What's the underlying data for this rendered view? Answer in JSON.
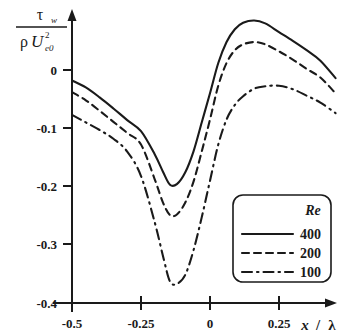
{
  "chart_data": {
    "type": "line",
    "title": "",
    "xlabel": "x / λ",
    "ylabel": "τ_w / (ρ U_e0^2)",
    "xlim": [
      -0.5,
      0.46
    ],
    "ylim": [
      -0.4,
      0.1
    ],
    "xticks": [
      -0.5,
      -0.25,
      0,
      0.25
    ],
    "xticklabels": [
      "-0.5",
      "-0.25",
      "0",
      "0.25"
    ],
    "yticks": [
      0,
      -0.1,
      -0.2,
      -0.3,
      -0.4
    ],
    "yticklabels": [
      "0",
      "-0.1",
      "-0.2",
      "-0.3",
      "-0.4"
    ],
    "grid": false,
    "legend_position": "lower-right",
    "legend_title": "Re",
    "series": [
      {
        "name": "400",
        "style": "solid",
        "x": [
          -0.5,
          -0.45,
          -0.4,
          -0.35,
          -0.3,
          -0.25,
          -0.2,
          -0.17,
          -0.145,
          -0.12,
          -0.09,
          -0.06,
          -0.03,
          0.0,
          0.03,
          0.06,
          0.09,
          0.12,
          0.16,
          0.2,
          0.25,
          0.3,
          0.35,
          0.4,
          0.455
        ],
        "y": [
          -0.018,
          -0.03,
          -0.047,
          -0.066,
          -0.086,
          -0.105,
          -0.145,
          -0.175,
          -0.197,
          -0.196,
          -0.176,
          -0.14,
          -0.09,
          -0.04,
          0.012,
          0.048,
          0.07,
          0.081,
          0.085,
          0.08,
          0.065,
          0.05,
          0.034,
          0.016,
          -0.014
        ]
      },
      {
        "name": "200",
        "style": "dashed",
        "x": [
          -0.5,
          -0.45,
          -0.4,
          -0.35,
          -0.3,
          -0.25,
          -0.2,
          -0.17,
          -0.145,
          -0.12,
          -0.09,
          -0.06,
          -0.03,
          0.0,
          0.03,
          0.06,
          0.09,
          0.12,
          0.16,
          0.2,
          0.25,
          0.3,
          0.35,
          0.4,
          0.455
        ],
        "y": [
          -0.038,
          -0.052,
          -0.07,
          -0.089,
          -0.108,
          -0.128,
          -0.188,
          -0.228,
          -0.249,
          -0.248,
          -0.228,
          -0.192,
          -0.14,
          -0.085,
          -0.027,
          0.012,
          0.034,
          0.044,
          0.048,
          0.044,
          0.032,
          0.018,
          0.002,
          -0.013,
          -0.04
        ]
      },
      {
        "name": "100",
        "style": "dashdot",
        "x": [
          -0.5,
          -0.45,
          -0.4,
          -0.35,
          -0.3,
          -0.25,
          -0.2,
          -0.17,
          -0.145,
          -0.12,
          -0.09,
          -0.06,
          -0.03,
          0.0,
          0.03,
          0.06,
          0.09,
          0.12,
          0.16,
          0.2,
          0.25,
          0.3,
          0.35,
          0.4,
          0.455
        ],
        "y": [
          -0.077,
          -0.09,
          -0.103,
          -0.118,
          -0.14,
          -0.182,
          -0.262,
          -0.32,
          -0.363,
          -0.367,
          -0.352,
          -0.31,
          -0.253,
          -0.19,
          -0.128,
          -0.085,
          -0.06,
          -0.045,
          -0.032,
          -0.028,
          -0.027,
          -0.033,
          -0.044,
          -0.056,
          -0.074
        ]
      }
    ],
    "annotations": []
  },
  "yaxis_label": {
    "numerator_symbol": "τ",
    "numerator_subscript": "w",
    "denominator_rho": "ρ",
    "denominator_u": "U",
    "denominator_subscript": "e0",
    "denominator_superscript": "2"
  },
  "xaxis_label": {
    "variable": "x",
    "separator": "/",
    "denominator": "λ"
  },
  "legend": {
    "title": "Re",
    "entries": [
      {
        "label": "400",
        "style": "solid"
      },
      {
        "label": "200",
        "style": "dashed"
      },
      {
        "label": "100",
        "style": "dashdot"
      }
    ]
  },
  "colors": {
    "ink": "#1a1a1a",
    "background": "#ffffff"
  }
}
